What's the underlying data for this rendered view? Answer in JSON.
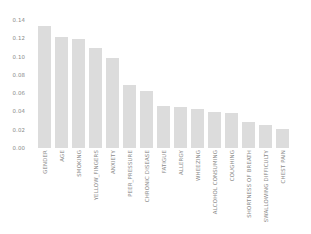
{
  "chart_data": {
    "type": "bar",
    "title": "",
    "subtitle": "",
    "xlabel": "",
    "ylabel": "",
    "grid": false,
    "legend": "none",
    "ylim": [
      0.0,
      0.14
    ],
    "ytick_labels": [
      "0.14",
      "0.12",
      "0.10",
      "0.08",
      "0.06",
      "0.04",
      "0.02",
      "0.00"
    ],
    "ytick_values": [
      0.14,
      0.12,
      0.1,
      0.08,
      0.06,
      0.04,
      0.02,
      0.0
    ],
    "categories": [
      "GENDER",
      "AGE",
      "SMOKING",
      "YELLOW_FINGERS",
      "ANXIETY",
      "PEER_PRESSURE",
      "CHRONIC DISEASE",
      "FATIGUE",
      "ALLERGY",
      "WHEEZING",
      "ALCOHOL CONSUMING",
      "COUGHING",
      "SHORTNESS OF BREATH",
      "SWALLOWING DIFFICULTY",
      "CHEST PAIN"
    ],
    "values": [
      0.1335,
      0.1215,
      0.119,
      0.1095,
      0.0985,
      0.069,
      0.0625,
      0.0465,
      0.0445,
      0.0425,
      0.039,
      0.038,
      0.029,
      0.0255,
      0.021
    ],
    "bar_color": "#dcdcdc",
    "background_color": "#ffffff",
    "tick_color": "#8a8a8a"
  }
}
